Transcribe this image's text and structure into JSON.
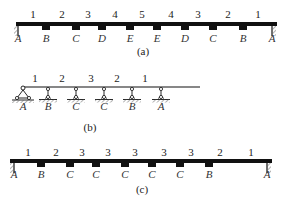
{
  "diagrams": [
    {
      "caption": "(a)",
      "beam": {
        "x1": 16,
        "x2": 277,
        "y": 24,
        "thickness": 4
      },
      "span_labels": [
        "1",
        "2",
        "3",
        "4",
        "5",
        "4",
        "3",
        "2",
        "1"
      ],
      "span_label_x": [
        33,
        62,
        88,
        115,
        142,
        171,
        198,
        228,
        258
      ],
      "supports": [
        {
          "letter": "A",
          "x": 18,
          "type": "fixed-left"
        },
        {
          "letter": "B",
          "x": 46,
          "type": "block"
        },
        {
          "letter": "C",
          "x": 76,
          "type": "block"
        },
        {
          "letter": "D",
          "x": 102,
          "type": "block"
        },
        {
          "letter": "E",
          "x": 130,
          "type": "block"
        },
        {
          "letter": "E",
          "x": 157,
          "type": "block"
        },
        {
          "letter": "D",
          "x": 185,
          "type": "block"
        },
        {
          "letter": "C",
          "x": 213,
          "type": "block"
        },
        {
          "letter": "B",
          "x": 243,
          "type": "block"
        },
        {
          "letter": "A",
          "x": 272,
          "type": "fixed-right"
        }
      ],
      "label_y": 18,
      "letter_y": 42,
      "caption_x": 143,
      "caption_y": 55
    },
    {
      "caption": "(b)",
      "beam": {
        "x1": 22,
        "x2": 200,
        "y": 87,
        "thickness": 1
      },
      "span_labels": [
        "1",
        "2",
        "3",
        "2",
        "1"
      ],
      "span_label_x": [
        35,
        62,
        91,
        117,
        145
      ],
      "supports": [
        {
          "letter": "A",
          "x": 23,
          "type": "pin"
        },
        {
          "letter": "B",
          "x": 48,
          "type": "pin-link"
        },
        {
          "letter": "C",
          "x": 76,
          "type": "pin-link"
        },
        {
          "letter": "C",
          "x": 104,
          "type": "pin-link"
        },
        {
          "letter": "B",
          "x": 132,
          "type": "pin-link"
        },
        {
          "letter": "A",
          "x": 161,
          "type": "pin-link"
        }
      ],
      "label_y": 82,
      "letter_y": 110,
      "caption_x": 90,
      "caption_y": 131
    },
    {
      "caption": "(c)",
      "beam": {
        "x1": 10,
        "x2": 272,
        "y": 161,
        "thickness": 4
      },
      "span_labels": [
        "1",
        "2",
        "3",
        "3",
        "3",
        "3",
        "3",
        "2",
        "1"
      ],
      "span_label_x": [
        28,
        56,
        82,
        108,
        135,
        164,
        191,
        220,
        251
      ],
      "supports": [
        {
          "letter": "A",
          "x": 14,
          "type": "fixed-left"
        },
        {
          "letter": "B",
          "x": 41,
          "type": "block"
        },
        {
          "letter": "C",
          "x": 70,
          "type": "block"
        },
        {
          "letter": "C",
          "x": 96,
          "type": "block"
        },
        {
          "letter": "C",
          "x": 125,
          "type": "block"
        },
        {
          "letter": "C",
          "x": 152,
          "type": "block"
        },
        {
          "letter": "C",
          "x": 180,
          "type": "block"
        },
        {
          "letter": "B",
          "x": 209,
          "type": "block"
        },
        {
          "letter": "A",
          "x": 267,
          "type": "fixed-right"
        }
      ],
      "label_y": 156,
      "letter_y": 178,
      "caption_x": 142,
      "caption_y": 193
    }
  ]
}
